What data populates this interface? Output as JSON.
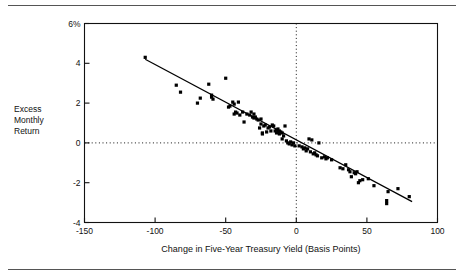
{
  "figure": {
    "rule_color": "#555555",
    "background": "#ffffff"
  },
  "chart_data": {
    "type": "scatter",
    "title": "",
    "xlabel": "Change in Five-Year Treasury Yield (Basis Points)",
    "ylabel": "Excess Monthly Return",
    "ylabel_lines": [
      "Excess",
      "Monthly",
      "Return"
    ],
    "xlim": [
      -150,
      100
    ],
    "ylim": [
      -4,
      6
    ],
    "xticks": [
      -150,
      -100,
      -50,
      0,
      50,
      100
    ],
    "xtick_labels": [
      "-150",
      "-100",
      "-50",
      "0",
      "50",
      "100"
    ],
    "yticks": [
      -4,
      -2,
      0,
      2,
      4,
      6
    ],
    "ytick_labels": [
      "-4",
      "-2",
      "0",
      "2",
      "4",
      "6%"
    ],
    "grid": false,
    "reference_lines": [
      {
        "name": "zero-return-line",
        "orientation": "horizontal",
        "value": 0,
        "style": "dotted"
      },
      {
        "name": "zero-yield-change-line",
        "orientation": "vertical",
        "value": 0,
        "style": "dotted"
      }
    ],
    "marker": {
      "shape": "square",
      "color": "#000000",
      "size_px": 3.2
    },
    "series": [
      {
        "name": "Excess Monthly Return vs Change in Five-Year Treasury Yield",
        "points": [
          [
            -107,
            4.3
          ],
          [
            -85,
            2.9
          ],
          [
            -82,
            2.55
          ],
          [
            -70,
            2.0
          ],
          [
            -68,
            2.25
          ],
          [
            -62,
            2.95
          ],
          [
            -60,
            2.4
          ],
          [
            -60,
            2.3
          ],
          [
            -59,
            2.2
          ],
          [
            -50,
            3.25
          ],
          [
            -48,
            1.8
          ],
          [
            -47,
            1.85
          ],
          [
            -45,
            2.05
          ],
          [
            -44,
            1.95
          ],
          [
            -44,
            1.45
          ],
          [
            -43,
            1.55
          ],
          [
            -42,
            1.5
          ],
          [
            -41,
            2.05
          ],
          [
            -40,
            1.4
          ],
          [
            -38,
            1.55
          ],
          [
            -37,
            1.05
          ],
          [
            -35,
            1.45
          ],
          [
            -33,
            1.4
          ],
          [
            -32,
            1.55
          ],
          [
            -31,
            1.3
          ],
          [
            -30,
            1.25
          ],
          [
            -30,
            1.45
          ],
          [
            -29,
            1.3
          ],
          [
            -28,
            1.2
          ],
          [
            -27,
            1.15
          ],
          [
            -26,
            0.75
          ],
          [
            -25,
            0.95
          ],
          [
            -25,
            1.2
          ],
          [
            -24,
            0.5
          ],
          [
            -24,
            0.45
          ],
          [
            -23,
            0.85
          ],
          [
            -22,
            0.9
          ],
          [
            -21,
            0.55
          ],
          [
            -20,
            0.75
          ],
          [
            -19,
            0.8
          ],
          [
            -18,
            0.6
          ],
          [
            -17,
            0.9
          ],
          [
            -16,
            0.85
          ],
          [
            -15,
            0.6
          ],
          [
            -14,
            0.65
          ],
          [
            -14,
            0.5
          ],
          [
            -13,
            0.55
          ],
          [
            -13,
            0.7
          ],
          [
            -12,
            0.6
          ],
          [
            -12,
            0.45
          ],
          [
            -11,
            0.55
          ],
          [
            -10,
            0.5
          ],
          [
            -10,
            0.2
          ],
          [
            -9,
            0.35
          ],
          [
            -8,
            0.85
          ],
          [
            -7,
            0.1
          ],
          [
            -6,
            0.0
          ],
          [
            -5,
            -0.05
          ],
          [
            -4,
            0.05
          ],
          [
            -3,
            -0.1
          ],
          [
            -2,
            0.0
          ],
          [
            -1,
            -0.15
          ],
          [
            2,
            -0.15
          ],
          [
            4,
            -0.2
          ],
          [
            5,
            -0.3
          ],
          [
            6,
            -0.25
          ],
          [
            7,
            -0.4
          ],
          [
            8,
            -0.3
          ],
          [
            9,
            0.2
          ],
          [
            10,
            -0.45
          ],
          [
            11,
            0.15
          ],
          [
            12,
            -0.55
          ],
          [
            13,
            -0.5
          ],
          [
            14,
            -0.6
          ],
          [
            15,
            -0.65
          ],
          [
            16,
            0.0
          ],
          [
            18,
            -0.75
          ],
          [
            20,
            -0.7
          ],
          [
            21,
            -0.8
          ],
          [
            22,
            -0.75
          ],
          [
            25,
            -0.85
          ],
          [
            31,
            -1.25
          ],
          [
            33,
            -1.3
          ],
          [
            35,
            -1.1
          ],
          [
            37,
            -1.35
          ],
          [
            38,
            -1.45
          ],
          [
            39,
            -1.7
          ],
          [
            41,
            -1.5
          ],
          [
            42,
            -1.55
          ],
          [
            43,
            -1.45
          ],
          [
            44,
            -2.0
          ],
          [
            45,
            -1.9
          ],
          [
            47,
            -1.85
          ],
          [
            51,
            -1.8
          ],
          [
            55,
            -2.15
          ],
          [
            64,
            -3.05
          ],
          [
            64,
            -2.9
          ],
          [
            65,
            -2.45
          ],
          [
            72,
            -2.3
          ],
          [
            80,
            -2.7
          ]
        ]
      }
    ],
    "trend_line": {
      "name": "fitted-regression-line",
      "x_start": -107,
      "y_start": 4.2,
      "x_end": 82,
      "y_end": -2.95,
      "style": "solid",
      "color": "#000000"
    }
  }
}
